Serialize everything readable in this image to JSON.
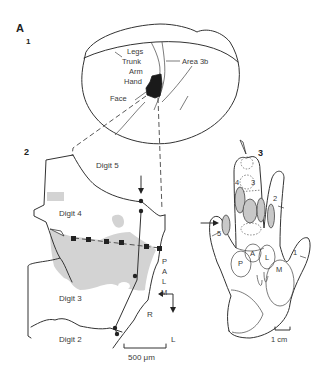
{
  "figure": {
    "label": "A",
    "panels": [
      {
        "number": "1",
        "labels": {
          "legs": "Legs",
          "trunk": "Trunk",
          "arm": "Arm",
          "hand": "Hand",
          "face": "Face",
          "area": "Area 3b"
        }
      },
      {
        "number": "2",
        "labels": {
          "digit5": "Digit 5",
          "digit4": "Digit 4",
          "digit3": "Digit 3",
          "digit2": "Digit 2",
          "palm": [
            "P",
            "A",
            "L",
            "M"
          ],
          "orient_r": "R",
          "orient_l": "L",
          "scale": "500 μm"
        }
      },
      {
        "number": "3",
        "labels": {
          "d1": "1",
          "d2": "2",
          "d3": "3",
          "d4": "4",
          "d5": "5",
          "pad_p": "P",
          "pad_a": "A",
          "pad_l": "L",
          "pad_m": "M",
          "scale": "1 cm"
        }
      }
    ],
    "colors": {
      "line": "#333333",
      "shade": "#d3d3d3",
      "fill_dark": "#1a1a1a"
    }
  }
}
